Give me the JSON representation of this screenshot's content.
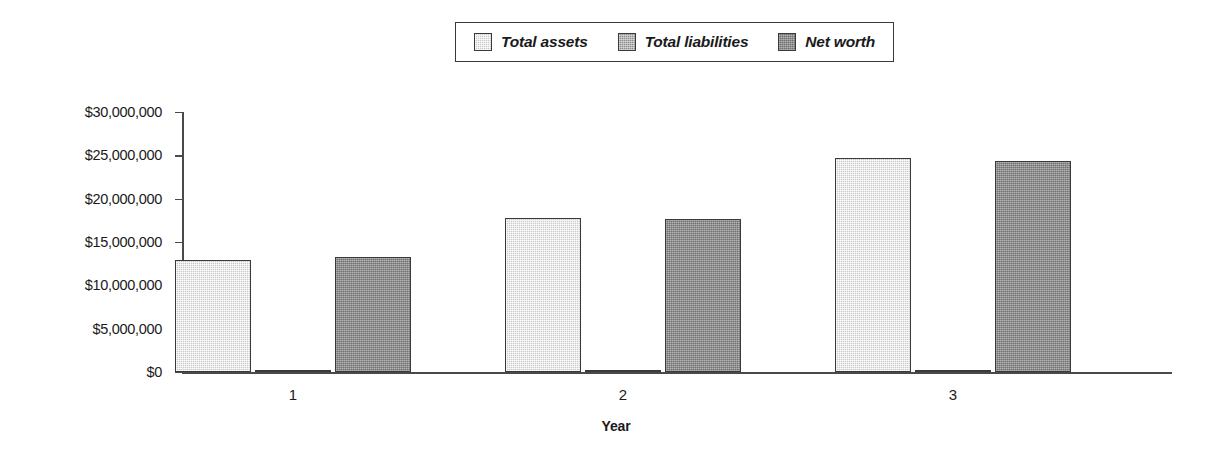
{
  "chart_data": {
    "type": "bar",
    "title": "",
    "xlabel": "Year",
    "ylabel": "",
    "categories": [
      "1",
      "2",
      "3"
    ],
    "ylim": [
      0,
      30000000
    ],
    "ytick_step": 5000000,
    "ytick_labels": [
      "$30,000,000",
      "$25,000,000",
      "$20,000,000",
      "$15,000,000",
      "$10,000,000",
      "$5,000,000",
      "$0"
    ],
    "ytick_values": [
      30000000,
      25000000,
      20000000,
      15000000,
      10000000,
      5000000,
      0
    ],
    "grid": false,
    "legend_position": "top-center",
    "series": [
      {
        "name": "Total assets",
        "color": "#c9c9c9",
        "values": [
          12900000,
          17800000,
          24700000
        ]
      },
      {
        "name": "Total liabilities",
        "color": "#8e8e8e",
        "values": [
          200000,
          200000,
          150000
        ]
      },
      {
        "name": "Net worth",
        "color": "#6f6f6f",
        "values": [
          13300000,
          17700000,
          24400000
        ]
      }
    ]
  },
  "legend": {
    "items": [
      {
        "label": "Total assets",
        "color": "#c9c9c9"
      },
      {
        "label": "Total liabilities",
        "color": "#8e8e8e"
      },
      {
        "label": "Net worth",
        "color": "#6f6f6f"
      }
    ]
  },
  "axes": {
    "x_title": "Year",
    "x_tick_labels": [
      "1",
      "2",
      "3"
    ],
    "y_tick_labels": [
      "$30,000,000",
      "$25,000,000",
      "$20,000,000",
      "$15,000,000",
      "$10,000,000",
      "$5,000,000",
      "$0"
    ]
  },
  "colors": {
    "axis": "#4a4a4a",
    "border": "#3a3a3a",
    "text": "#1a1a1a",
    "background": "#ffffff"
  }
}
